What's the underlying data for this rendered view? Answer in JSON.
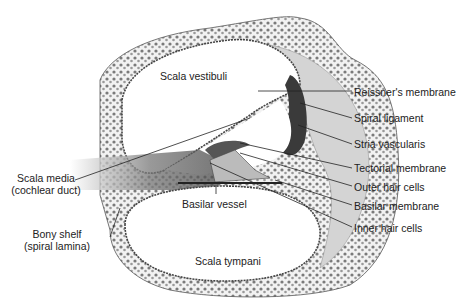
{
  "regions": {
    "scala_vestibuli": "Scala vestibuli",
    "scala_tympani": "Scala tympani",
    "basilar_vessel": "Basilar vessel"
  },
  "left_labels": [
    {
      "line1": "Scala media",
      "line2": "(cochlear duct)"
    },
    {
      "line1": "Bony shelf",
      "line2": "(spiral lamina)"
    }
  ],
  "right_labels": [
    "Reissner's membrane",
    "Spiral ligament",
    "Stria vascularis",
    "Tectorial membrane",
    "Outer hair cells",
    "Basilar membrane",
    "Inner hair cells"
  ],
  "colors": {
    "line": "#222222",
    "bone_fill": "#efefef",
    "bone_dots": "#6a6a6a",
    "ligament": "#c8c8c8",
    "stria": "#3a3a3a",
    "nerve": "#555555"
  }
}
